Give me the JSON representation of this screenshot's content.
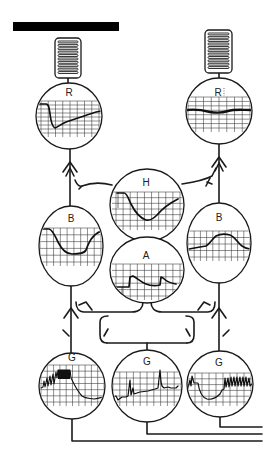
{
  "figure": {
    "colors": {
      "ink": "#1a1a1a",
      "background": "#ffffff"
    }
  },
  "header_bar": {
    "color": "#000000"
  },
  "receptors": [
    {
      "id": "coil-left",
      "type": "coil-organ"
    },
    {
      "id": "coil-right",
      "type": "coil-organ"
    }
  ],
  "scopes": [
    {
      "id": "R-left",
      "label": "R",
      "trace": "sharp-drop-slow-recovery"
    },
    {
      "id": "R-right",
      "label": "R",
      "trace": "flat-slight-dip"
    },
    {
      "id": "H",
      "label": "H",
      "trace": "plateau-drop-recovery"
    },
    {
      "id": "B-left",
      "label": "B",
      "trace": "broad-trough"
    },
    {
      "id": "B-right",
      "label": "B",
      "trace": "broad-hump"
    },
    {
      "id": "A",
      "label": "A",
      "trace": "two-step-transients"
    },
    {
      "id": "G-left",
      "label": "G",
      "trace": "dense-burst-then-decay"
    },
    {
      "id": "G-middle",
      "label": "G",
      "trace": "sparse-spikes"
    },
    {
      "id": "G-right",
      "label": "G",
      "trace": "dip-then-spike-train"
    }
  ]
}
